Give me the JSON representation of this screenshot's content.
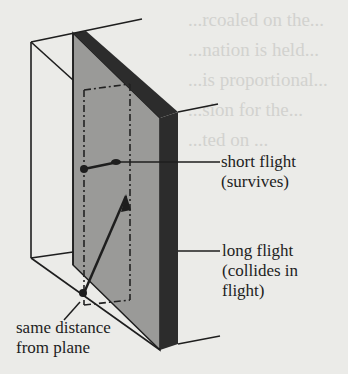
{
  "background_text": [
    "...rcoaled on the...",
    "...nation is held...",
    "...is proportional...",
    "...sion for the...",
    "...ted on ..."
  ],
  "diagram": {
    "colors": {
      "plane_face": "#9a9a98",
      "plane_edge": "#2c2c2c",
      "line": "#1e1e1e",
      "paper": "#ebebe8"
    }
  },
  "labels": {
    "short_flight": {
      "line1": "short flight",
      "line2": "(survives)"
    },
    "long_flight": {
      "line1": "long flight",
      "line2": "(collides in",
      "line3": "flight)"
    },
    "same_distance": {
      "line1": "same distance",
      "line2": "from plane"
    }
  }
}
